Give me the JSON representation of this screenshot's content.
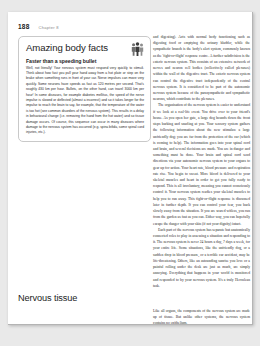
{
  "document": {
    "type": "textbook-page",
    "folio": "188",
    "running_head": "Chapter 8"
  },
  "feature_box": {
    "title": "Amazing body facts",
    "icon": "people-figures-icon",
    "subtitle": "Faster than a speeding bullet",
    "paragraphs": [
      "Well, not literally! Your nervous system must respond very quickly to stimuli. Think about how fast you pull your hand away from a hot plate or step on the brake when something runs in front of your car. Nerve impulses can move very quickly. Some neurons have speeds as fast as 120 metres per second. That's roughly 430 km per hour. Bullets, on the other hand, can travel 3000 km per hour! In some diseases, for example diabetes mellitus, the speed of the nerve impulse is slowed or deflected (almost a incorrect) and so it takes longer for the impulse to reach the brain to say, for example, that the temperature of the water is too hot (see common disorders of the nervous system). This results in a delay in behavioural change (i.e. removing the hand from the hot water) and so tissue damage occurs. Of course, this sequence can occur in many diseases where damage to the nervous system has occurred (e.g. spina bifida, some spinal cord injuries, etc.)."
    ]
  },
  "main_text": {
    "column_right": [
      "and digesting). Acts with normal body functioning such as digesting food or emptying the urinary bladder, while the sympathetic branch is the body's alert system, commonly known as the 'fight-or-flight' response centre. A further subdivision is the enteric nervous system. This consists of an extensive network of nerves and neuron cell bodies (collectively called plexuses) within the wall of the digestive tract. The enteric nervous system can control the digestive tract independently of the central nervous system. It is considered to be part of the autonomic nervous system because of the parasympathetic and sympathetic neurons, which contribute to the plexuses.",
      "The organisation of the nervous system is easier to understand if we look at a real-life event. You drive over to your friend's house. As you open her gate, a large dog bounds down the front steps barking and snarling at you. Your sensory system gathers the following information about the new stimulus: a large unfriendly dog; you are far from the protection of the car (which is coming to help). The information goes into your spinal cord and brain, and several decisions are made. You are in danger and something must be done. Your brain and spinal cord send directions via your autonomic nervous system to your organs to gear up for action. Your heart rate, blood pressure and respiration rate rise. You begin to sweat. More blood is delivered to your skeletal muscles and heart in order to get you fully ready to respond. This is all involuntary, meaning you cannot consciously control it. Your nervous system readies your skeletal muscles to help you to run away. This fight-or-flight response is discussed later in further depth. If you can control your fear, you back slowly away from the situation. If you are scared witless, you run from the garden as fast as you can. Either way, you can hopefully escape the danger with your skin (if not your dignity) intact.",
      "Each part of the nervous system has separate but anatomically connected roles to play in assessing a situation and responding to it. The nervous system is never 24 hours a day, 7 days a week, for your entire life. Some situations, like the unfriendly dog, or a sudden drop in blood pressure, or a terrible car accident, may be life-threatening. Others, like an astounding sunrise you love or a painful rolling under the desk are just as much, are simply annoying. Everything that happens in your world is monitored and responded to by your nervous system. It's a truly Herculean task."
    ]
  },
  "section": {
    "heading": "Nervous tissue",
    "body": "Like all organs, the components of the nervous system are made up of tissue. But unlike other systems, the nervous system contains no epithelium."
  },
  "colors": {
    "page_background": "#ffffff",
    "canvas_background": "#e9e9e9",
    "box_border": "#c9c9c9",
    "text": "#2a2a2a",
    "muted": "#8a8a8a"
  }
}
